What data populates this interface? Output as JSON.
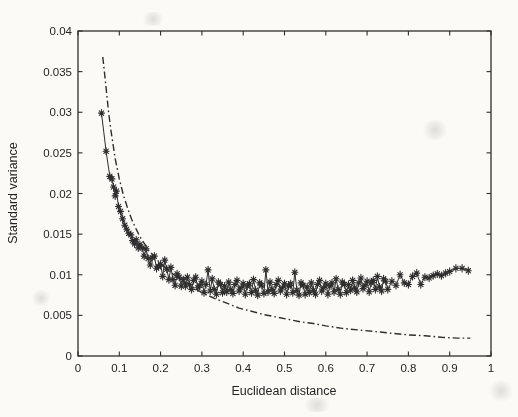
{
  "figure": {
    "background": "#fbfaf7",
    "ink": "#2e2e2e",
    "plot_box": {
      "left": 78,
      "top": 31,
      "right": 491,
      "bottom": 356
    }
  },
  "chart_data": {
    "type": "scatter",
    "title": "",
    "xlabel": "Euclidean distance",
    "ylabel": "Standard variance",
    "xlim": [
      0,
      1
    ],
    "ylim": [
      0,
      0.04
    ],
    "grid": false,
    "legend": null,
    "x_ticks": [
      0,
      0.1,
      0.2,
      0.3,
      0.4,
      0.5,
      0.6,
      0.7,
      0.8,
      0.9,
      1
    ],
    "x_tick_labels": [
      "0",
      "0.1",
      "0.2",
      "0.3",
      "0.4",
      "0.5",
      "0.6",
      "0.7",
      "0.8",
      "0.9",
      "1"
    ],
    "y_ticks": [
      0,
      0.005,
      0.01,
      0.015,
      0.02,
      0.025,
      0.03,
      0.035,
      0.04
    ],
    "y_tick_labels": [
      "0",
      "0.005",
      "0.01",
      "0.015",
      "0.02",
      "0.025",
      "0.03",
      "0.035",
      "0.04"
    ],
    "series": [
      {
        "name": "measured standard variance",
        "style": "solid-line-with-asterisk-markers",
        "color": "#2e2e2e",
        "points": [
          [
            0.057,
            0.0299
          ],
          [
            0.068,
            0.0252
          ],
          [
            0.077,
            0.0221
          ],
          [
            0.082,
            0.0218
          ],
          [
            0.086,
            0.0208
          ],
          [
            0.09,
            0.0197
          ],
          [
            0.093,
            0.0203
          ],
          [
            0.098,
            0.0184
          ],
          [
            0.103,
            0.0178
          ],
          [
            0.108,
            0.0169
          ],
          [
            0.113,
            0.0161
          ],
          [
            0.118,
            0.0156
          ],
          [
            0.123,
            0.0151
          ],
          [
            0.128,
            0.0149
          ],
          [
            0.132,
            0.0142
          ],
          [
            0.137,
            0.0138
          ],
          [
            0.141,
            0.0143
          ],
          [
            0.146,
            0.0133
          ],
          [
            0.15,
            0.0137
          ],
          [
            0.155,
            0.0133
          ],
          [
            0.16,
            0.0123
          ],
          [
            0.165,
            0.0132
          ],
          [
            0.17,
            0.012
          ],
          [
            0.175,
            0.0112
          ],
          [
            0.18,
            0.0121
          ],
          [
            0.185,
            0.0123
          ],
          [
            0.19,
            0.0108
          ],
          [
            0.195,
            0.011
          ],
          [
            0.2,
            0.0113
          ],
          [
            0.205,
            0.0098
          ],
          [
            0.21,
            0.0118
          ],
          [
            0.215,
            0.0107
          ],
          [
            0.22,
            0.0094
          ],
          [
            0.225,
            0.0109
          ],
          [
            0.23,
            0.0094
          ],
          [
            0.235,
            0.0087
          ],
          [
            0.24,
            0.0101
          ],
          [
            0.245,
            0.0097
          ],
          [
            0.25,
            0.0086
          ],
          [
            0.255,
            0.0094
          ],
          [
            0.26,
            0.0086
          ],
          [
            0.265,
            0.0097
          ],
          [
            0.27,
            0.0088
          ],
          [
            0.275,
            0.0082
          ],
          [
            0.28,
            0.0093
          ],
          [
            0.285,
            0.0097
          ],
          [
            0.29,
            0.0084
          ],
          [
            0.295,
            0.0087
          ],
          [
            0.3,
            0.0092
          ],
          [
            0.305,
            0.0078
          ],
          [
            0.31,
            0.0088
          ],
          [
            0.315,
            0.0106
          ],
          [
            0.32,
            0.008
          ],
          [
            0.325,
            0.0095
          ],
          [
            0.33,
            0.0082
          ],
          [
            0.335,
            0.0076
          ],
          [
            0.34,
            0.0091
          ],
          [
            0.345,
            0.0088
          ],
          [
            0.35,
            0.0078
          ],
          [
            0.355,
            0.0086
          ],
          [
            0.36,
            0.0079
          ],
          [
            0.365,
            0.0091
          ],
          [
            0.37,
            0.0082
          ],
          [
            0.375,
            0.0077
          ],
          [
            0.38,
            0.0088
          ],
          [
            0.385,
            0.0093
          ],
          [
            0.39,
            0.008
          ],
          [
            0.395,
            0.0084
          ],
          [
            0.4,
            0.0089
          ],
          [
            0.405,
            0.0076
          ],
          [
            0.41,
            0.0086
          ],
          [
            0.415,
            0.0089
          ],
          [
            0.42,
            0.0078
          ],
          [
            0.425,
            0.0094
          ],
          [
            0.43,
            0.0081
          ],
          [
            0.435,
            0.0075
          ],
          [
            0.44,
            0.009
          ],
          [
            0.445,
            0.0087
          ],
          [
            0.45,
            0.0077
          ],
          [
            0.455,
            0.0106
          ],
          [
            0.46,
            0.0079
          ],
          [
            0.465,
            0.0091
          ],
          [
            0.47,
            0.0082
          ],
          [
            0.475,
            0.0077
          ],
          [
            0.48,
            0.0088
          ],
          [
            0.485,
            0.0093
          ],
          [
            0.49,
            0.008
          ],
          [
            0.495,
            0.0084
          ],
          [
            0.5,
            0.0089
          ],
          [
            0.505,
            0.0076
          ],
          [
            0.51,
            0.0086
          ],
          [
            0.515,
            0.0089
          ],
          [
            0.52,
            0.0078
          ],
          [
            0.525,
            0.0103
          ],
          [
            0.53,
            0.0081
          ],
          [
            0.535,
            0.0075
          ],
          [
            0.54,
            0.009
          ],
          [
            0.545,
            0.0087
          ],
          [
            0.55,
            0.0076
          ],
          [
            0.555,
            0.0085
          ],
          [
            0.56,
            0.0078
          ],
          [
            0.565,
            0.009
          ],
          [
            0.57,
            0.0081
          ],
          [
            0.575,
            0.0076
          ],
          [
            0.58,
            0.0088
          ],
          [
            0.585,
            0.0093
          ],
          [
            0.59,
            0.008
          ],
          [
            0.595,
            0.0084
          ],
          [
            0.6,
            0.0089
          ],
          [
            0.605,
            0.0076
          ],
          [
            0.61,
            0.0086
          ],
          [
            0.615,
            0.009
          ],
          [
            0.62,
            0.0079
          ],
          [
            0.625,
            0.0095
          ],
          [
            0.63,
            0.0082
          ],
          [
            0.635,
            0.0076
          ],
          [
            0.64,
            0.0091
          ],
          [
            0.645,
            0.0088
          ],
          [
            0.65,
            0.0078
          ],
          [
            0.655,
            0.0088
          ],
          [
            0.66,
            0.0081
          ],
          [
            0.665,
            0.0093
          ],
          [
            0.67,
            0.0084
          ],
          [
            0.675,
            0.0079
          ],
          [
            0.68,
            0.009
          ],
          [
            0.685,
            0.0096
          ],
          [
            0.69,
            0.0083
          ],
          [
            0.695,
            0.0087
          ],
          [
            0.7,
            0.0092
          ],
          [
            0.705,
            0.0079
          ],
          [
            0.71,
            0.009
          ],
          [
            0.715,
            0.0093
          ],
          [
            0.72,
            0.0082
          ],
          [
            0.725,
            0.0098
          ],
          [
            0.73,
            0.0085
          ],
          [
            0.735,
            0.008
          ],
          [
            0.74,
            0.0095
          ],
          [
            0.745,
            0.0092
          ],
          [
            0.75,
            0.0082
          ],
          [
            0.76,
            0.0092
          ],
          [
            0.77,
            0.0087
          ],
          [
            0.78,
            0.01
          ],
          [
            0.79,
            0.009
          ],
          [
            0.8,
            0.0088
          ],
          [
            0.81,
            0.0098
          ],
          [
            0.82,
            0.0102
          ],
          [
            0.83,
            0.0088
          ],
          [
            0.84,
            0.0097
          ],
          [
            0.85,
            0.0096
          ],
          [
            0.86,
            0.0099
          ],
          [
            0.87,
            0.0101
          ],
          [
            0.88,
            0.0099
          ],
          [
            0.89,
            0.0102
          ],
          [
            0.9,
            0.0104
          ],
          [
            0.915,
            0.0108
          ],
          [
            0.93,
            0.0108
          ],
          [
            0.945,
            0.0105
          ]
        ]
      },
      {
        "name": "fitted curve",
        "style": "dash-dot-line",
        "color": "#2e2e2e",
        "points": [
          [
            0.06,
            0.0368
          ],
          [
            0.068,
            0.033
          ],
          [
            0.074,
            0.03
          ],
          [
            0.08,
            0.0277
          ],
          [
            0.09,
            0.0243
          ],
          [
            0.1,
            0.0218
          ],
          [
            0.11,
            0.0198
          ],
          [
            0.12,
            0.0182
          ],
          [
            0.13,
            0.0168
          ],
          [
            0.14,
            0.0157
          ],
          [
            0.15,
            0.0147
          ],
          [
            0.16,
            0.0139
          ],
          [
            0.17,
            0.0131
          ],
          [
            0.18,
            0.0125
          ],
          [
            0.19,
            0.0119
          ],
          [
            0.2,
            0.0114
          ],
          [
            0.22,
            0.0105
          ],
          [
            0.24,
            0.0097
          ],
          [
            0.26,
            0.009
          ],
          [
            0.28,
            0.0084
          ],
          [
            0.3,
            0.0078
          ],
          [
            0.33,
            0.0071
          ],
          [
            0.36,
            0.0065
          ],
          [
            0.39,
            0.0059
          ],
          [
            0.42,
            0.0055
          ],
          [
            0.45,
            0.0051
          ],
          [
            0.48,
            0.0048
          ],
          [
            0.51,
            0.0045
          ],
          [
            0.54,
            0.0042
          ],
          [
            0.57,
            0.004
          ],
          [
            0.6,
            0.0037
          ],
          [
            0.64,
            0.0034
          ],
          [
            0.68,
            0.0032
          ],
          [
            0.72,
            0.003
          ],
          [
            0.76,
            0.0028
          ],
          [
            0.8,
            0.0026
          ],
          [
            0.84,
            0.0025
          ],
          [
            0.88,
            0.0023
          ],
          [
            0.92,
            0.0022
          ],
          [
            0.95,
            0.0022
          ]
        ]
      }
    ]
  }
}
